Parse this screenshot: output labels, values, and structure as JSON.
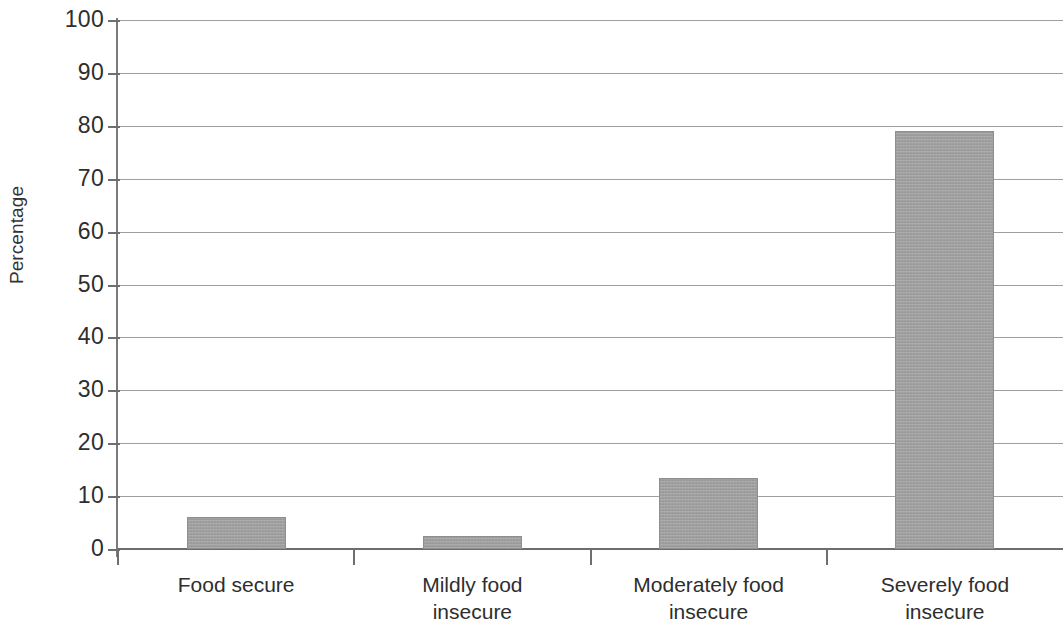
{
  "chart_data": {
    "type": "bar",
    "title": "",
    "subtitle": "",
    "xlabel": "",
    "ylabel": "Percentage",
    "categories": [
      "Food secure",
      "Mildly food\ninsecure",
      "Moderately food\ninsecure",
      "Severely food\ninsecure"
    ],
    "values": [
      6.0,
      2.5,
      13.4,
      79.0
    ],
    "ylim": [
      0,
      100
    ],
    "ytick_labels": [
      "100",
      "90",
      "80",
      "70",
      "60",
      "50",
      "40",
      "30",
      "20",
      "10",
      "0"
    ],
    "ytick_values": [
      100,
      90,
      80,
      70,
      60,
      50,
      40,
      30,
      20,
      10,
      0
    ],
    "grid": true,
    "legend": false,
    "legend_position": "none",
    "bar_color": "#a0a0a0",
    "gridline_color": "#8e8e8e",
    "axis_color": "#6f6f6f",
    "text_color": "#2e2e2e",
    "background_color": "#ffffff"
  }
}
